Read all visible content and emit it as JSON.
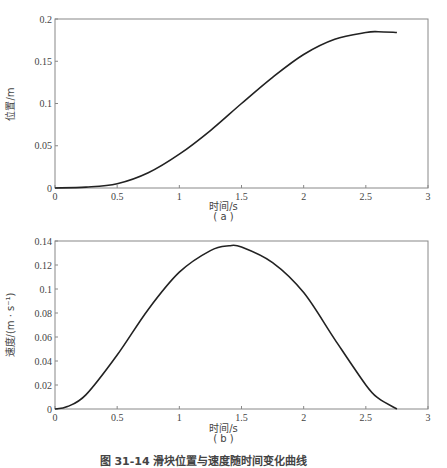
{
  "chart_data": [
    {
      "type": "line",
      "panel": "(a)",
      "title": "",
      "xlabel": "时间/s",
      "ylabel": "位置/m",
      "xlim": [
        0,
        3
      ],
      "ylim": [
        0,
        0.2
      ],
      "xticks": [
        "0",
        "0.5",
        "1",
        "1.5",
        "2",
        "2.5",
        "3"
      ],
      "yticks": [
        "0",
        "0.05",
        "0.1",
        "0.15",
        "0.2"
      ],
      "grid": false,
      "series": [
        {
          "name": "位置",
          "x": [
            0,
            0.25,
            0.5,
            0.75,
            1.0,
            1.25,
            1.5,
            1.75,
            2.0,
            2.25,
            2.5,
            2.6,
            2.75
          ],
          "values": [
            0,
            0.001,
            0.005,
            0.018,
            0.04,
            0.068,
            0.1,
            0.131,
            0.158,
            0.176,
            0.184,
            0.185,
            0.184
          ]
        }
      ]
    },
    {
      "type": "line",
      "panel": "(b)",
      "title": "",
      "xlabel": "时间/s",
      "ylabel": "速度/(m · s⁻¹)",
      "xlim": [
        0,
        3
      ],
      "ylim": [
        0,
        0.14
      ],
      "xticks": [
        "0",
        "0.5",
        "1",
        "1.5",
        "2",
        "2.5",
        "3"
      ],
      "yticks": [
        "0",
        "0.02",
        "0.04",
        "0.06",
        "0.08",
        "0.1",
        "0.12",
        "0.14"
      ],
      "grid": false,
      "series": [
        {
          "name": "速度",
          "x": [
            0,
            0.1,
            0.25,
            0.5,
            0.75,
            1.0,
            1.25,
            1.4,
            1.5,
            1.75,
            2.0,
            2.25,
            2.5,
            2.6,
            2.75
          ],
          "values": [
            0,
            0.002,
            0.012,
            0.045,
            0.083,
            0.114,
            0.132,
            0.136,
            0.135,
            0.122,
            0.097,
            0.058,
            0.02,
            0.009,
            0.0
          ]
        }
      ]
    }
  ],
  "panels": {
    "a": {
      "xlabel": "时间/s",
      "tag": "( a )",
      "ylabel": "位置/m"
    },
    "b": {
      "xlabel": "时间/s",
      "tag": "( b )",
      "ylabel": "速度/(m · s⁻¹)"
    }
  },
  "caption": "图 31-14  滑块位置与速度随时间变化曲线"
}
